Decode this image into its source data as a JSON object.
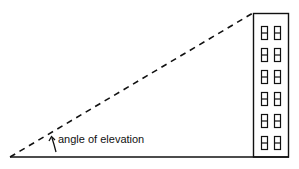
{
  "diagram": {
    "label": "angle of elevation",
    "building": {
      "rows": 6,
      "columns": 2
    },
    "colors": {
      "stroke": "#111111",
      "background": "#ffffff"
    }
  }
}
